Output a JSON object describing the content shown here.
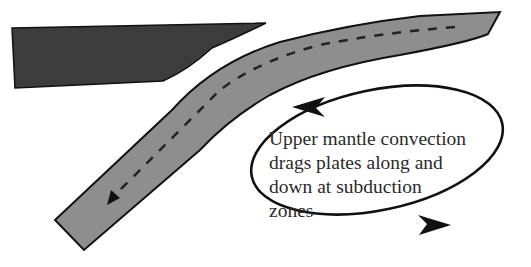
{
  "diagram": {
    "type": "subduction-convection-schematic",
    "colors": {
      "overriding_plate": "#3c3c3c",
      "subducting_plate": "#8e8e8e",
      "outline": "#111111",
      "background": "#ffffff",
      "text": "#2a2a2a"
    },
    "elements": {
      "overriding_plate": "dark wedge-shaped plate, upper left",
      "subducting_plate": "grey curved plate bending downward to lower left",
      "motion_path": "dashed line with arrowhead along the subducting plate",
      "convection_cell": "elliptical loop with two arrowheads indicating rotation"
    },
    "caption_lines": [
      "Upper mantle convection",
      "drags plates along and",
      "down at subduction",
      "zones"
    ]
  }
}
